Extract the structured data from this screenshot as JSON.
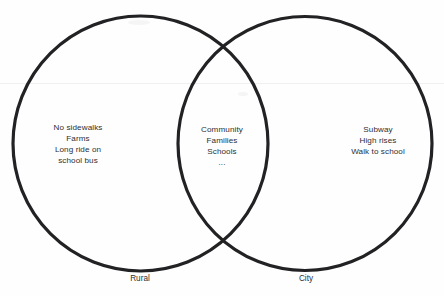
{
  "diagram": {
    "type": "venn",
    "stroke_color": "#222225",
    "background_color": "#ffffff",
    "text_color": "#2e2e32",
    "left_set": {
      "label": "Rural",
      "items": [
        "No sidewalks",
        "Farms",
        "Long ride on",
        "school bus"
      ]
    },
    "right_set": {
      "label": "City",
      "items": [
        "Subway",
        "High rises",
        "Walk to school"
      ]
    },
    "intersection": {
      "items": [
        "Community",
        "Families",
        "Schools",
        "..."
      ]
    }
  }
}
